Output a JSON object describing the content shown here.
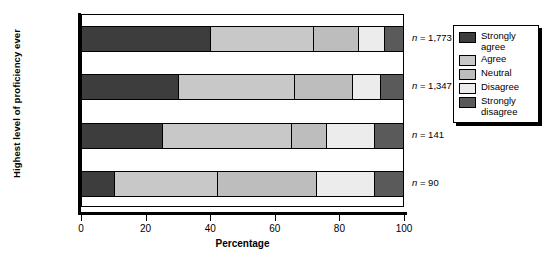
{
  "chart_data": {
    "type": "bar",
    "orientation": "horizontal",
    "stacked": true,
    "normalized_percent": true,
    "title": "",
    "xlabel": "Percentage",
    "ylabel": "Highest level of proficiency ever",
    "xlim": [
      0,
      100
    ],
    "xticks": [
      0,
      20,
      40,
      60,
      80,
      100
    ],
    "xticklabels": [
      "0",
      "20",
      "40",
      "60",
      "80",
      "100"
    ],
    "grid": false,
    "legend_position": "right-outside",
    "categories": [
      "High",
      "Moderate",
      "Minimal",
      "None"
    ],
    "series": [
      {
        "name": "Strongly agree",
        "color": "#3d3d3d",
        "values": [
          40,
          30,
          25,
          10
        ]
      },
      {
        "name": "Agree",
        "color": "#c8c8c8",
        "values": [
          32,
          36,
          40,
          32
        ]
      },
      {
        "name": "Neutral",
        "color": "#bdbdbd",
        "values": [
          14,
          18,
          11,
          31
        ]
      },
      {
        "name": "Disagree",
        "color": "#ececec",
        "values": [
          8,
          9,
          15,
          18
        ]
      },
      {
        "name": "Strongly disagree",
        "color": "#5a5a5a",
        "values": [
          6,
          7,
          9,
          9
        ]
      }
    ],
    "annotations": [
      {
        "category": "High",
        "text": "n = 1,773",
        "n": 1773
      },
      {
        "category": "Moderate",
        "text": "n = 1,347",
        "n": 1347
      },
      {
        "category": "Minimal",
        "text": "n = 141",
        "n": 141
      },
      {
        "category": "None",
        "text": "n = 90",
        "n": 90
      }
    ]
  },
  "legend": {
    "items": [
      {
        "label": "Strongly agree",
        "color": "#3d3d3d"
      },
      {
        "label": "Agree",
        "color": "#c8c8c8"
      },
      {
        "label": "Neutral",
        "color": "#bdbdbd"
      },
      {
        "label": "Disagree",
        "color": "#ececec"
      },
      {
        "label": "Strongly disagree",
        "color": "#5a5a5a"
      }
    ]
  }
}
